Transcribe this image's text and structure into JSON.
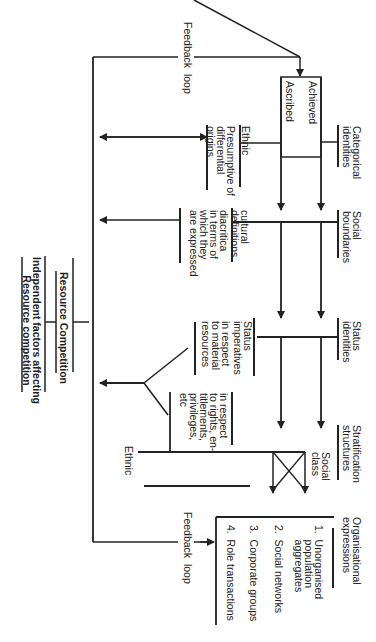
{
  "orientation": "rotated 90 degrees clockwise",
  "feedback_loop_top": "Feedback  loop",
  "feedback_loop_bottom": "Feedback  loop",
  "categorical_identities": "Categorical\nidentities",
  "achieved": "Achieved",
  "ascribed": "Ascribed",
  "ethnic_top": "Ethnic",
  "ethnic_desc": "Presumptive of\ndifferential\norigins",
  "social_boundaries": "Social\nboundaries",
  "cultural_def_title": "cultural\ndefinitions",
  "cultural_def_desc": "diacritica\nin terms of\nwhich they\nare expressed",
  "status_identities": "Status\nidentities",
  "status_imperatives_title": "Status\nimperatives",
  "status_imperatives_desc": "in respect\nto material\nresources",
  "rights_desc": "in respect\nto rights, en-\ntitlements,\nprivileges,\netc",
  "stratification_structures": "Stratification\nstructures",
  "social_class": "Social\nclass",
  "ethnic_bottom": "Ethnic",
  "organisational_expressions": {
    "title": "Organisational\nexpressions",
    "items": [
      "1.  Unorganised\n     population\n     aggregates",
      "2.  Social networks",
      "3.  Corporate groups",
      "4.  Role transactions"
    ]
  },
  "resource_competition": "Resource Competition",
  "independent_factors": "Independent factors affecting\nResource competition"
}
